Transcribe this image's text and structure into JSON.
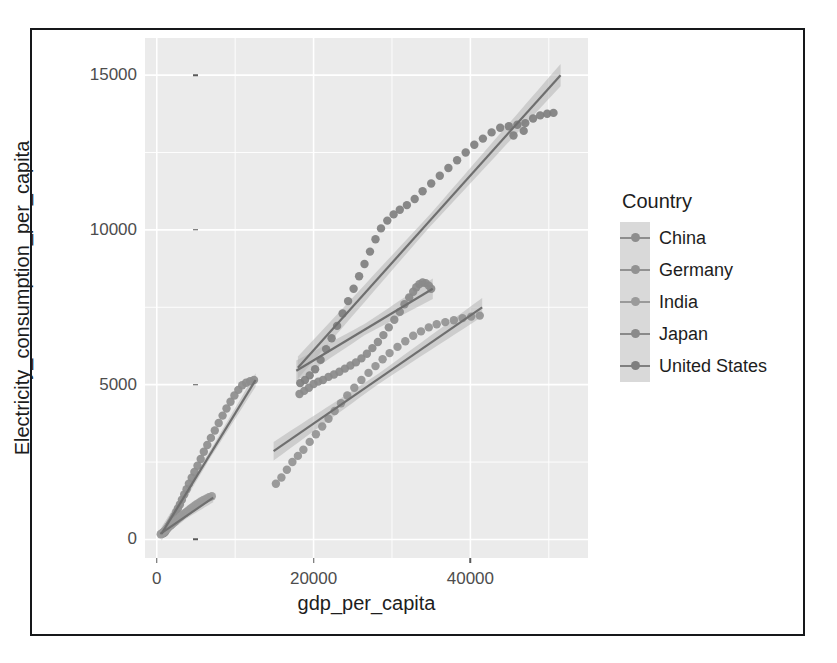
{
  "chart_data": {
    "type": "scatter",
    "title": "",
    "xlabel": "gdp_per_capita",
    "ylabel": "Electricity_consumption_per_capita",
    "xlim": [
      -1500,
      55000
    ],
    "ylim": [
      -600,
      16200
    ],
    "xticks": [
      0,
      20000,
      40000
    ],
    "xticklabels": [
      "0",
      "20000",
      "40000"
    ],
    "yticks": [
      0,
      5000,
      10000,
      15000
    ],
    "yticklabels": [
      "0",
      "5000",
      "10000",
      "15000"
    ],
    "grid": true,
    "grid_color": "#ffffff",
    "panel_background": "#ebebeb",
    "legend": {
      "title": "Country",
      "position": "right",
      "entries": [
        "China",
        "Germany",
        "India",
        "Japan",
        "United States"
      ]
    },
    "smoothing": "linear regression with 95% confidence band",
    "series": [
      {
        "name": "China",
        "color": "#8d8d8d",
        "fit_line": {
          "x": [
            600,
            12600
          ],
          "y": [
            180,
            5150
          ]
        },
        "fit_band_halfwidth": 220,
        "points": [
          {
            "x": 700,
            "y": 180
          },
          {
            "x": 820,
            "y": 200
          },
          {
            "x": 950,
            "y": 215
          },
          {
            "x": 1080,
            "y": 250
          },
          {
            "x": 1200,
            "y": 300
          },
          {
            "x": 1350,
            "y": 360
          },
          {
            "x": 1500,
            "y": 430
          },
          {
            "x": 1680,
            "y": 500
          },
          {
            "x": 1850,
            "y": 570
          },
          {
            "x": 2050,
            "y": 660
          },
          {
            "x": 2250,
            "y": 760
          },
          {
            "x": 2480,
            "y": 880
          },
          {
            "x": 2700,
            "y": 1000
          },
          {
            "x": 2950,
            "y": 1130
          },
          {
            "x": 3200,
            "y": 1280
          },
          {
            "x": 3500,
            "y": 1450
          },
          {
            "x": 3800,
            "y": 1620
          },
          {
            "x": 4100,
            "y": 1800
          },
          {
            "x": 4450,
            "y": 1990
          },
          {
            "x": 4800,
            "y": 2180
          },
          {
            "x": 5200,
            "y": 2380
          },
          {
            "x": 5600,
            "y": 2600
          },
          {
            "x": 6000,
            "y": 2830
          },
          {
            "x": 6450,
            "y": 3050
          },
          {
            "x": 6900,
            "y": 3280
          },
          {
            "x": 7400,
            "y": 3520
          },
          {
            "x": 7900,
            "y": 3760
          },
          {
            "x": 8400,
            "y": 4000
          },
          {
            "x": 8900,
            "y": 4230
          },
          {
            "x": 9400,
            "y": 4450
          },
          {
            "x": 9900,
            "y": 4650
          },
          {
            "x": 10400,
            "y": 4830
          },
          {
            "x": 10900,
            "y": 4980
          },
          {
            "x": 11400,
            "y": 5060
          },
          {
            "x": 11900,
            "y": 5110
          },
          {
            "x": 12400,
            "y": 5150
          }
        ]
      },
      {
        "name": "India",
        "color": "#9a9a9a",
        "fit_line": {
          "x": [
            450,
            7200
          ],
          "y": [
            180,
            1350
          ]
        },
        "fit_band_halfwidth": 150,
        "points": [
          {
            "x": 500,
            "y": 170
          },
          {
            "x": 620,
            "y": 190
          },
          {
            "x": 740,
            "y": 210
          },
          {
            "x": 870,
            "y": 240
          },
          {
            "x": 1000,
            "y": 270
          },
          {
            "x": 1150,
            "y": 305
          },
          {
            "x": 1300,
            "y": 340
          },
          {
            "x": 1460,
            "y": 380
          },
          {
            "x": 1620,
            "y": 420
          },
          {
            "x": 1800,
            "y": 460
          },
          {
            "x": 1980,
            "y": 500
          },
          {
            "x": 2180,
            "y": 545
          },
          {
            "x": 2380,
            "y": 590
          },
          {
            "x": 2600,
            "y": 640
          },
          {
            "x": 2820,
            "y": 690
          },
          {
            "x": 3060,
            "y": 740
          },
          {
            "x": 3300,
            "y": 790
          },
          {
            "x": 3560,
            "y": 845
          },
          {
            "x": 3820,
            "y": 900
          },
          {
            "x": 4100,
            "y": 955
          },
          {
            "x": 4380,
            "y": 1010
          },
          {
            "x": 4680,
            "y": 1065
          },
          {
            "x": 4980,
            "y": 1120
          },
          {
            "x": 5300,
            "y": 1175
          },
          {
            "x": 5620,
            "y": 1225
          },
          {
            "x": 5960,
            "y": 1275
          },
          {
            "x": 6300,
            "y": 1320
          },
          {
            "x": 6660,
            "y": 1360
          },
          {
            "x": 7020,
            "y": 1395
          }
        ]
      },
      {
        "name": "Japan",
        "color": "#8a8a8a",
        "fit_line": {
          "x": [
            17800,
            35200
          ],
          "y": [
            5450,
            8100
          ]
        },
        "fit_band_halfwidth": 330,
        "points": [
          {
            "x": 18200,
            "y": 4700
          },
          {
            "x": 18800,
            "y": 4800
          },
          {
            "x": 19400,
            "y": 4900
          },
          {
            "x": 20000,
            "y": 5020
          },
          {
            "x": 20600,
            "y": 5100
          },
          {
            "x": 21200,
            "y": 5150
          },
          {
            "x": 21900,
            "y": 5250
          },
          {
            "x": 22600,
            "y": 5330
          },
          {
            "x": 23300,
            "y": 5420
          },
          {
            "x": 24000,
            "y": 5520
          },
          {
            "x": 24700,
            "y": 5620
          },
          {
            "x": 25400,
            "y": 5720
          },
          {
            "x": 26100,
            "y": 5850
          },
          {
            "x": 26800,
            "y": 6000
          },
          {
            "x": 27500,
            "y": 6180
          },
          {
            "x": 28200,
            "y": 6380
          },
          {
            "x": 28900,
            "y": 6600
          },
          {
            "x": 29600,
            "y": 6850
          },
          {
            "x": 30300,
            "y": 7100
          },
          {
            "x": 31000,
            "y": 7350
          },
          {
            "x": 31600,
            "y": 7600
          },
          {
            "x": 32200,
            "y": 7820
          },
          {
            "x": 32700,
            "y": 8000
          },
          {
            "x": 33100,
            "y": 8150
          },
          {
            "x": 33500,
            "y": 8250
          },
          {
            "x": 33900,
            "y": 8300
          },
          {
            "x": 34300,
            "y": 8280
          },
          {
            "x": 34700,
            "y": 8200
          },
          {
            "x": 35000,
            "y": 8100
          }
        ]
      },
      {
        "name": "Germany",
        "color": "#929292",
        "fit_line": {
          "x": [
            14900,
            41500
          ],
          "y": [
            2850,
            7500
          ]
        },
        "fit_band_halfwidth": 300,
        "points": [
          {
            "x": 15200,
            "y": 1800
          },
          {
            "x": 15900,
            "y": 2000
          },
          {
            "x": 16600,
            "y": 2250
          },
          {
            "x": 17300,
            "y": 2500
          },
          {
            "x": 18000,
            "y": 2700
          },
          {
            "x": 18700,
            "y": 2900
          },
          {
            "x": 19500,
            "y": 3150
          },
          {
            "x": 20300,
            "y": 3400
          },
          {
            "x": 21100,
            "y": 3650
          },
          {
            "x": 21900,
            "y": 3900
          },
          {
            "x": 22700,
            "y": 4150
          },
          {
            "x": 23500,
            "y": 4400
          },
          {
            "x": 24300,
            "y": 4650
          },
          {
            "x": 25200,
            "y": 4900
          },
          {
            "x": 26100,
            "y": 5150
          },
          {
            "x": 27000,
            "y": 5380
          },
          {
            "x": 27900,
            "y": 5600
          },
          {
            "x": 28800,
            "y": 5820
          },
          {
            "x": 29700,
            "y": 6020
          },
          {
            "x": 30700,
            "y": 6220
          },
          {
            "x": 31700,
            "y": 6400
          },
          {
            "x": 32700,
            "y": 6580
          },
          {
            "x": 33700,
            "y": 6720
          },
          {
            "x": 34700,
            "y": 6850
          },
          {
            "x": 35700,
            "y": 6950
          },
          {
            "x": 36800,
            "y": 7020
          },
          {
            "x": 37900,
            "y": 7080
          },
          {
            "x": 39000,
            "y": 7150
          },
          {
            "x": 40100,
            "y": 7200
          },
          {
            "x": 41200,
            "y": 7230
          }
        ]
      },
      {
        "name": "United States",
        "color": "#7f7f7f",
        "fit_line": {
          "x": [
            18000,
            51500
          ],
          "y": [
            5550,
            15000
          ]
        },
        "fit_band_halfwidth": 360,
        "points": [
          {
            "x": 18300,
            "y": 5050
          },
          {
            "x": 18900,
            "y": 5150
          },
          {
            "x": 19500,
            "y": 5300
          },
          {
            "x": 20200,
            "y": 5500
          },
          {
            "x": 20900,
            "y": 5800
          },
          {
            "x": 21600,
            "y": 6150
          },
          {
            "x": 22300,
            "y": 6500
          },
          {
            "x": 23000,
            "y": 6900
          },
          {
            "x": 23700,
            "y": 7300
          },
          {
            "x": 24400,
            "y": 7700
          },
          {
            "x": 25100,
            "y": 8100
          },
          {
            "x": 25800,
            "y": 8500
          },
          {
            "x": 26500,
            "y": 8900
          },
          {
            "x": 27200,
            "y": 9300
          },
          {
            "x": 27900,
            "y": 9700
          },
          {
            "x": 28600,
            "y": 10050
          },
          {
            "x": 29400,
            "y": 10300
          },
          {
            "x": 30200,
            "y": 10500
          },
          {
            "x": 31000,
            "y": 10650
          },
          {
            "x": 31900,
            "y": 10800
          },
          {
            "x": 32900,
            "y": 11000
          },
          {
            "x": 33900,
            "y": 11250
          },
          {
            "x": 35000,
            "y": 11500
          },
          {
            "x": 36100,
            "y": 11750
          },
          {
            "x": 37200,
            "y": 12000
          },
          {
            "x": 38300,
            "y": 12250
          },
          {
            "x": 39400,
            "y": 12500
          },
          {
            "x": 40500,
            "y": 12750
          },
          {
            "x": 41600,
            "y": 12950
          },
          {
            "x": 42700,
            "y": 13150
          },
          {
            "x": 43800,
            "y": 13300
          },
          {
            "x": 44900,
            "y": 13350
          },
          {
            "x": 46000,
            "y": 13400
          },
          {
            "x": 47000,
            "y": 13450
          },
          {
            "x": 48000,
            "y": 13600
          },
          {
            "x": 48900,
            "y": 13700
          },
          {
            "x": 49800,
            "y": 13750
          },
          {
            "x": 50600,
            "y": 13780
          },
          {
            "x": 45500,
            "y": 13050
          },
          {
            "x": 46800,
            "y": 13200
          }
        ]
      }
    ]
  }
}
